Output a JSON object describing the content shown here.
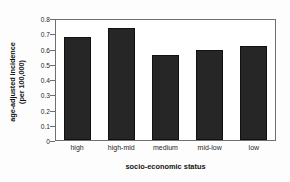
{
  "chart_data": {
    "type": "bar",
    "title": "",
    "xlabel": "socio-economic status",
    "ylabel": "age-adjusted incidence (per 100,000)",
    "ylabel_lines": [
      "age-adjusted incidence",
      "(per 100,000)"
    ],
    "categories": [
      "high",
      "high-mid",
      "medium",
      "mid-low",
      "low"
    ],
    "values": [
      0.685,
      0.748,
      0.568,
      0.598,
      0.625
    ],
    "ylim": [
      0,
      0.8
    ],
    "yticks": [
      "0",
      "0.1",
      "0.2",
      "0.3",
      "0.4",
      "0.5",
      "0.6",
      "0.7",
      "0.8"
    ],
    "ytick_values": [
      0,
      0.1,
      0.2,
      0.3,
      0.4,
      0.5,
      0.6,
      0.7,
      0.8
    ],
    "grid": false,
    "legend": "none",
    "bar_color": "#262626",
    "axis_color": "#6f6f6f",
    "background_color": "#ffffff"
  }
}
